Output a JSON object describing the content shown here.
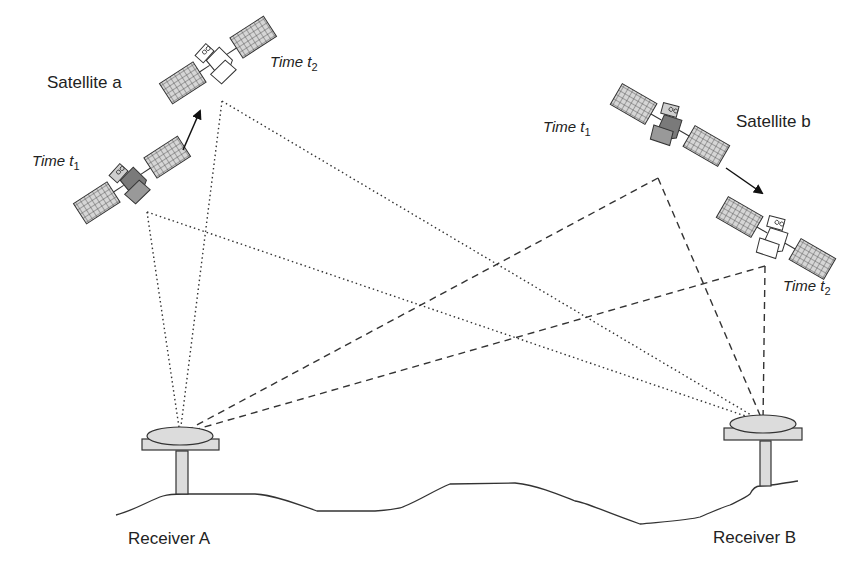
{
  "labels": {
    "satellite_a": "Satellite a",
    "satellite_b": "Satellite b",
    "receiver_a": "Receiver A",
    "receiver_b": "Receiver B",
    "time_prefix": "Time t",
    "sub_1": "1",
    "sub_2": "2"
  },
  "satellites": [
    {
      "name": "Satellite a",
      "epochs": [
        {
          "label": "Time t1",
          "apex": [
            147,
            212
          ]
        },
        {
          "label": "Time t2",
          "apex": [
            222,
            101
          ]
        }
      ],
      "line_style": "dotted"
    },
    {
      "name": "Satellite b",
      "epochs": [
        {
          "label": "Time t1",
          "apex": [
            658,
            178
          ]
        },
        {
          "label": "Time t2",
          "apex": [
            765,
            266
          ]
        }
      ],
      "line_style": "dashed"
    }
  ],
  "receivers": [
    {
      "name": "Receiver A",
      "antenna": [
        180,
        434
      ]
    },
    {
      "name": "Receiver B",
      "antenna": [
        763,
        422
      ]
    }
  ],
  "colors": {
    "line": "#333333",
    "panel_fill": "#d9d9d9",
    "body_dark": "#707070",
    "receiver_fill": "#dcdcdc"
  }
}
